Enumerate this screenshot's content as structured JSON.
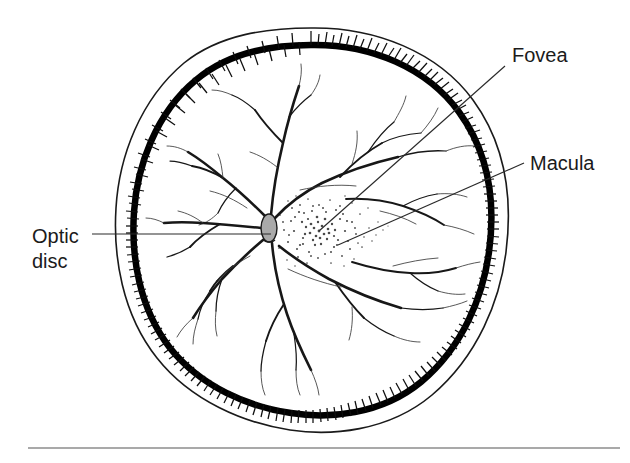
{
  "figure": {
    "background_color": "#ffffff",
    "ink_color": "#171717",
    "rule_color": "#8d8d8d"
  },
  "labels": [
    {
      "id": "fovea",
      "text": "Fovea",
      "x": 512,
      "y": 62,
      "anchor": "start",
      "leader": {
        "x1": 505,
        "y1": 66,
        "x2": 319,
        "y2": 231
      }
    },
    {
      "id": "macula",
      "text": "Macula",
      "x": 530,
      "y": 170,
      "anchor": "start",
      "leader": {
        "x1": 524,
        "y1": 163,
        "x2": 338,
        "y2": 245
      }
    },
    {
      "id": "optic-disc-line1",
      "text": "Optic",
      "x": 32,
      "y": 243,
      "anchor": "start",
      "leader": {
        "x1": 92,
        "y1": 234,
        "x2": 271,
        "y2": 234
      }
    },
    {
      "id": "optic-disc-line2",
      "text": "disc",
      "x": 32,
      "y": 268,
      "anchor": "start",
      "leader": null
    }
  ],
  "structures": {
    "optic_disc": {
      "name": "optic-disc",
      "cx": 269,
      "cy": 228,
      "rx": 8,
      "ry": 14,
      "fill": "#a9a9a9",
      "stroke": "#1a1a1a"
    },
    "macula_region": {
      "name": "macula-stipple",
      "cx": 322,
      "cy": 232,
      "rx": 46,
      "ry": 33,
      "stipple_color": "#4a4a4a"
    },
    "fovea_point": {
      "name": "fovea-center",
      "cx": 319,
      "cy": 231,
      "r": 7
    },
    "retina_outer": {
      "name": "retina-outer-outline",
      "cx": 311,
      "cy": 229,
      "rx": 196,
      "ry": 201
    },
    "ora_serrata": {
      "name": "ora-serrata-band",
      "cx": 311,
      "cy": 229,
      "rx": 181,
      "ry": 186,
      "spike_count": 150
    }
  },
  "baseline_rule": {
    "name": "bottom-rule",
    "x1": 28,
    "y1": 448,
    "x2": 620,
    "y2": 448
  }
}
